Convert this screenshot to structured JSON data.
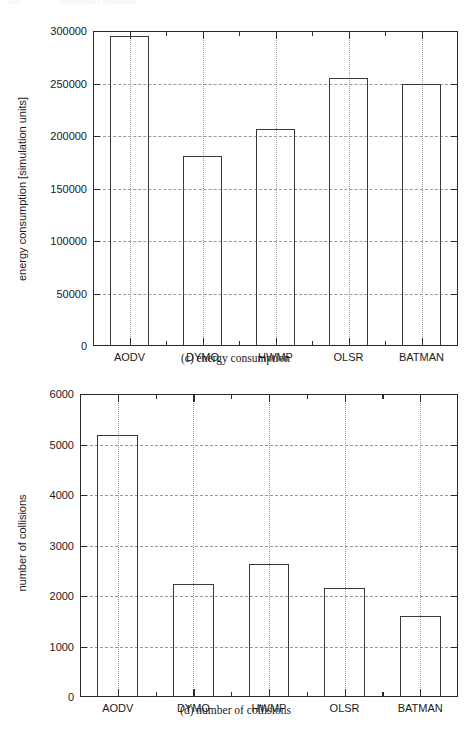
{
  "page_header": {
    "number": "206",
    "title": "Performance evaluation"
  },
  "figures": [
    {
      "id": "energy",
      "caption": "(c) energy consumption",
      "chart_data": {
        "type": "bar",
        "title": "",
        "xlabel": "",
        "ylabel": "energy consumption [simulation units]",
        "categories": [
          "AODV",
          "DYMO",
          "HWMP",
          "OLSR",
          "BATMAN"
        ],
        "values": [
          295000,
          181000,
          207000,
          255000,
          250000
        ],
        "ylim": [
          0,
          300000
        ],
        "yticks": [
          0,
          50000,
          100000,
          150000,
          200000,
          250000,
          300000
        ],
        "ytick_labels": [
          "0",
          "50000",
          "100000",
          "150000",
          "200000",
          "250000",
          "300000"
        ],
        "grid": "both-dashed-dotted",
        "legend": "none"
      }
    },
    {
      "id": "collisions",
      "caption": "(d) number of collisions",
      "chart_data": {
        "type": "bar",
        "title": "",
        "xlabel": "",
        "ylabel": "number of collisions",
        "categories": [
          "AODV",
          "DYMO",
          "HWMP",
          "OLSR",
          "BATMAN"
        ],
        "values": [
          5190,
          2230,
          2630,
          2160,
          1600
        ],
        "ylim": [
          0,
          6000
        ],
        "yticks": [
          0,
          1000,
          2000,
          3000,
          4000,
          5000,
          6000
        ],
        "ytick_labels": [
          "0",
          "1000",
          "2000",
          "3000",
          "4000",
          "5000",
          "6000"
        ],
        "grid": "both-dashed-dotted",
        "legend": "none"
      }
    }
  ]
}
